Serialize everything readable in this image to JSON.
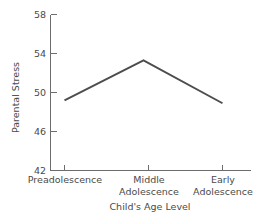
{
  "chart_data": {
    "type": "line",
    "title": "",
    "subtitle": "",
    "xlabel": "Child's Age Level",
    "ylabel": "Parental Stress",
    "categories": [
      "Preadolescence",
      "Middle Adolescence",
      "Early Adolescence"
    ],
    "category_lines": [
      [
        "Preadolescence"
      ],
      [
        "Middle",
        "Adolescence"
      ],
      [
        "Early",
        "Adolescence"
      ]
    ],
    "values": [
      49.2,
      53.3,
      48.9
    ],
    "series": [
      {
        "name": "Parental Stress",
        "values": [
          49.2,
          53.3,
          48.9
        ]
      }
    ],
    "ylim": [
      42,
      58
    ],
    "yticks": [
      58,
      54,
      50,
      46,
      42
    ],
    "ytick_labels": [
      "58",
      "54",
      "50",
      "46",
      "42"
    ],
    "grid": false,
    "legend": false,
    "legend_position": "none",
    "line_color": "#4d4d4d",
    "axis_color": "#6d6d6d",
    "text_color": "#4a4a4a",
    "background": "#ffffff",
    "markers": false
  }
}
